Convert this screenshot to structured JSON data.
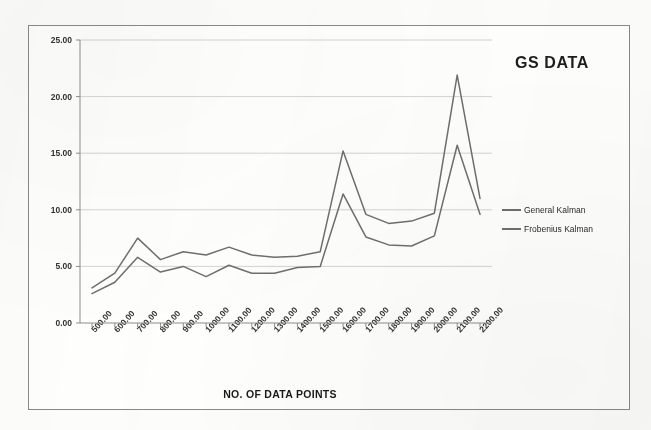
{
  "chart_data": {
    "type": "line",
    "title": "GS DATA",
    "xlabel": "NO. OF DATA POINTS",
    "ylabel": "",
    "grid": true,
    "legend_position": "right",
    "xlim": [
      500,
      2200
    ],
    "ylim": [
      0,
      25
    ],
    "ytick_labels": [
      "0.00",
      "5.00",
      "10.00",
      "15.00",
      "20.00",
      "25.00"
    ],
    "ytick_values": [
      0,
      5,
      10,
      15,
      20,
      25
    ],
    "categories": [
      "500.00",
      "600.00",
      "700.00",
      "800.00",
      "900.00",
      "1000.00",
      "1100.00",
      "1200.00",
      "1300.00",
      "1400.00",
      "1500.00",
      "1600.00",
      "1700.00",
      "1800.00",
      "1900.00",
      "2000.00",
      "2100.00",
      "2200.00"
    ],
    "x": [
      500,
      600,
      700,
      800,
      900,
      1000,
      1100,
      1200,
      1300,
      1400,
      1500,
      1600,
      1700,
      1800,
      1900,
      2000,
      2100,
      2200
    ],
    "series": [
      {
        "name": "General Kalman",
        "color": "#6f6f6f",
        "values": [
          2.6,
          3.6,
          5.8,
          4.5,
          5.0,
          4.1,
          5.1,
          4.4,
          4.4,
          4.9,
          5.0,
          11.4,
          7.6,
          6.9,
          6.8,
          7.7,
          15.7,
          9.6
        ]
      },
      {
        "name": "Frobenius Kalman",
        "color": "#6f6f6f",
        "values": [
          3.1,
          4.4,
          7.5,
          5.6,
          6.3,
          6.0,
          6.7,
          6.0,
          5.8,
          5.9,
          6.3,
          15.2,
          9.6,
          8.8,
          9.0,
          9.7,
          21.9,
          11.0
        ]
      }
    ]
  },
  "legend": {
    "items": [
      {
        "label": "General Kalman"
      },
      {
        "label": "Frobenius Kalman"
      }
    ]
  }
}
